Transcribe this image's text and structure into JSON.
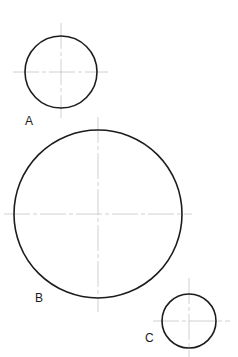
{
  "diagram": {
    "background": "#ffffff",
    "outline_color": "#1c1c1c",
    "centerline_color": "#c4c4c4",
    "circles": [
      {
        "id": "A",
        "label": "A",
        "cx": 61,
        "cy": 72,
        "r": 36,
        "vline": {
          "y1": 23,
          "y2": 118
        },
        "hline": {
          "x1": 13,
          "x2": 108
        },
        "label_pos": {
          "x": 25,
          "y": 125
        }
      },
      {
        "id": "B",
        "label": "B",
        "cx": 98,
        "cy": 214,
        "r": 84,
        "vline": {
          "y1": 117,
          "y2": 312
        },
        "hline": {
          "x1": 4,
          "x2": 192
        },
        "label_pos": {
          "x": 35,
          "y": 302
        }
      },
      {
        "id": "C",
        "label": "C",
        "cx": 189,
        "cy": 321,
        "r": 27,
        "vline": {
          "y1": 278,
          "y2": 357
        },
        "hline": {
          "x1": 153,
          "x2": 230
        },
        "label_pos": {
          "x": 145,
          "y": 342
        }
      }
    ]
  }
}
